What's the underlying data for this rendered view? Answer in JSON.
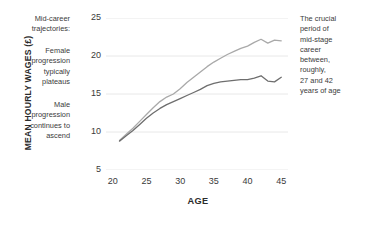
{
  "annotations": {
    "left": [
      "Mid-career\ntrajectories:",
      "Female\nprogression\ntypically\nplateaus",
      "Male\nprogression\ncontinues to\nascend"
    ],
    "right": "The crucial\nperiod of\nmid-stage\ncareer\nbetween,\nroughly,\n27 and 42\nyears of age"
  },
  "chart_data": {
    "type": "line",
    "title": "",
    "xlabel": "AGE",
    "ylabel": "MEAN HOURLY WAGES (£)",
    "xlim": [
      19,
      46
    ],
    "ylim": [
      5,
      25
    ],
    "xticks": [
      20,
      25,
      30,
      35,
      40,
      45
    ],
    "yticks": [
      5,
      10,
      15,
      20,
      25
    ],
    "grid": "horizontal",
    "legend": "none",
    "colors": {
      "male": "#a9a9a9",
      "female": "#6e6e6e",
      "grid": "#e8e8e8"
    },
    "x": [
      21,
      22,
      23,
      24,
      25,
      26,
      27,
      28,
      29,
      30,
      31,
      32,
      33,
      34,
      35,
      36,
      37,
      38,
      39,
      40,
      41,
      42,
      43,
      44,
      45
    ],
    "series": [
      {
        "name": "Male",
        "color": "#a9a9a9",
        "values": [
          8.9,
          9.7,
          10.5,
          11.4,
          12.3,
          13.2,
          14.0,
          14.6,
          15.0,
          15.7,
          16.5,
          17.2,
          17.9,
          18.6,
          19.2,
          19.7,
          20.2,
          20.6,
          21.0,
          21.3,
          21.8,
          22.2,
          21.7,
          22.1,
          22.0
        ]
      },
      {
        "name": "Female",
        "color": "#6e6e6e",
        "values": [
          8.8,
          9.5,
          10.2,
          11.0,
          11.8,
          12.5,
          13.1,
          13.6,
          14.0,
          14.4,
          14.8,
          15.2,
          15.6,
          16.1,
          16.4,
          16.6,
          16.7,
          16.8,
          16.9,
          16.9,
          17.1,
          17.4,
          16.7,
          16.6,
          17.2
        ]
      }
    ]
  }
}
